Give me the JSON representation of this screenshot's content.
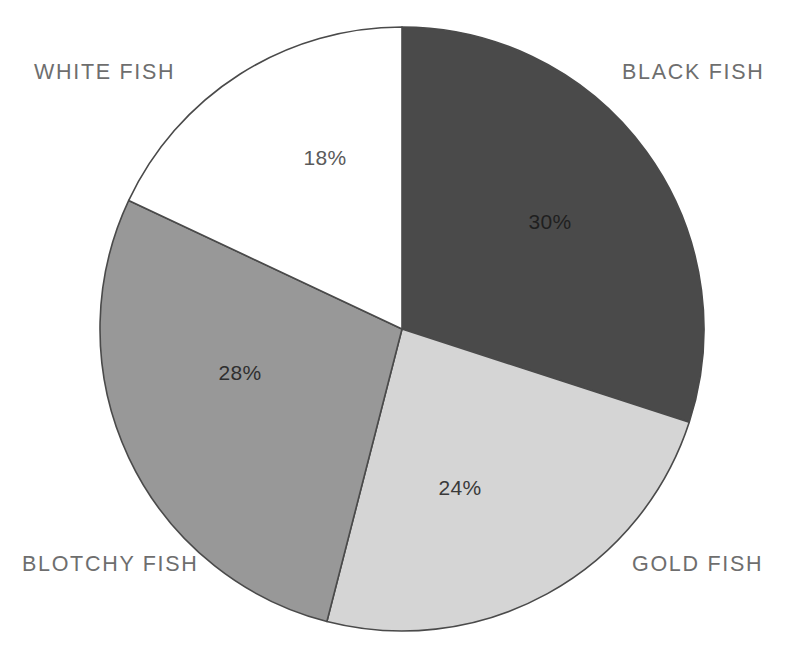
{
  "chart_data": {
    "type": "pie",
    "title": "",
    "subtitle": "",
    "xlabel": "",
    "ylabel": "",
    "legend_position": "around-slices",
    "grid": false,
    "start_angle_deg": 0,
    "direction": "clockwise",
    "center": {
      "x": 402,
      "y": 329
    },
    "radius": 302,
    "categories": [
      "BLACK FISH",
      "GOLD FISH",
      "BLOTCHY FISH",
      "WHITE FISH"
    ],
    "values": [
      30,
      24,
      28,
      18
    ],
    "value_labels": [
      "30%",
      "24%",
      "28%",
      "18%"
    ],
    "unit": "%",
    "total": 100,
    "colors": [
      "#4a4a4a",
      "#d5d5d5",
      "#989898",
      "#ffffff"
    ],
    "slices": [
      {
        "name": "BLACK FISH",
        "value": 30,
        "value_label": "30%",
        "fill": "#4a4a4a",
        "stroke": "#3c3c3c",
        "value_text_color": "#1f1f1f",
        "start_deg": 0,
        "end_deg": 108,
        "label_x": 550,
        "label_y": 223,
        "category_label_color": "#6e6e6e"
      },
      {
        "name": "GOLD FISH",
        "value": 24,
        "value_label": "24%",
        "fill": "#d5d5d5",
        "stroke": "#4a4a4a",
        "value_text_color": "#3a3a3a",
        "start_deg": 108,
        "end_deg": 194.4,
        "label_x": 460,
        "label_y": 489,
        "category_label_color": "#6e6e6e"
      },
      {
        "name": "BLOTCHY FISH",
        "value": 28,
        "value_label": "28%",
        "fill": "#989898",
        "stroke": "#4a4a4a",
        "value_text_color": "#2f2f2f",
        "start_deg": 194.4,
        "end_deg": 295.2,
        "label_x": 240,
        "label_y": 374,
        "category_label_color": "#6e6e6e"
      },
      {
        "name": "WHITE FISH",
        "value": 18,
        "value_label": "18%",
        "fill": "#ffffff",
        "stroke": "#4a4a4a",
        "value_text_color": "#5a5a5a",
        "start_deg": 295.2,
        "end_deg": 360,
        "label_x": 325,
        "label_y": 159,
        "category_label_color": "#6e6e6e"
      }
    ]
  },
  "labels": {
    "white_fish": "WHITE FISH",
    "black_fish": "BLACK FISH",
    "blotchy_fish": "BLOTCHY FISH",
    "gold_fish": "GOLD FISH"
  },
  "values": {
    "white_fish": "18%",
    "black_fish": "30%",
    "blotchy_fish": "28%",
    "gold_fish": "24%"
  },
  "colors": {
    "background": "#ffffff",
    "outline": "#4a4a4a",
    "label_text": "#6e6e6e",
    "black_fish_fill": "#4a4a4a",
    "gold_fish_fill": "#d5d5d5",
    "blotchy_fish_fill": "#989898",
    "white_fish_fill": "#ffffff"
  }
}
